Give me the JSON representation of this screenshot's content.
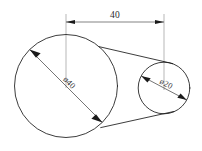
{
  "drawing": {
    "title": "two-circle tangent profile",
    "background_color": "#ffffff",
    "line_color": "#1a1a1a",
    "dimension_color": "#4d4d4d",
    "extension_color": "#9a9a9a",
    "dimensions": {
      "center_distance": {
        "label": "40",
        "orientation": "horizontal",
        "position": "top"
      },
      "large_circle_diameter": {
        "label": "ø40",
        "symbol": "ø",
        "value": "40",
        "orientation": "rotated",
        "angle_deg": 45
      },
      "small_circle_diameter": {
        "label": "ø20",
        "symbol": "ø",
        "value": "20",
        "orientation": "rotated",
        "angle_deg": 28
      }
    },
    "geometry": {
      "large_circle": {
        "cx": 66,
        "cy": 86,
        "r": 51.5
      },
      "small_circle": {
        "cx": 164,
        "cy": 88,
        "r": 25.8
      }
    }
  }
}
